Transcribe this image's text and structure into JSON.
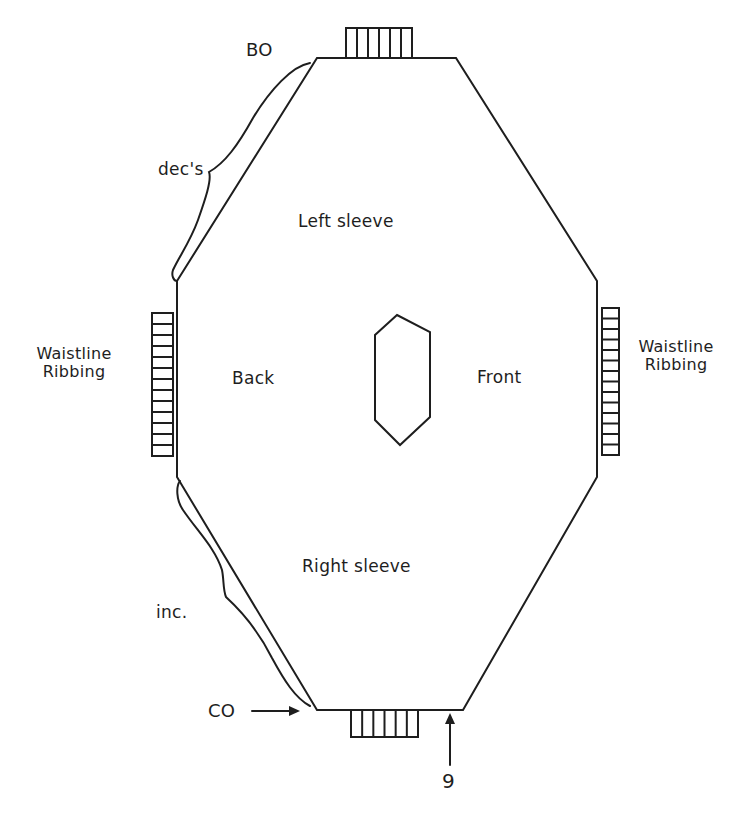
{
  "diagram": {
    "labels": {
      "bind_off": "BO",
      "decreases": "dec's",
      "left_sleeve": "Left sleeve",
      "back": "Back",
      "front": "Front",
      "waistline_ribbing_left": "Waistline\nRibbing",
      "waistline_ribbing_right": "Waistline\nRibbing",
      "right_sleeve": "Right sleeve",
      "increases": "inc.",
      "cast_on": "CO",
      "marker": "9"
    },
    "colors": {
      "ink": "#1e1e1e",
      "paper": "#ffffff"
    },
    "outline_points": [
      [
        317,
        58
      ],
      [
        456,
        58
      ],
      [
        597,
        281
      ],
      [
        597,
        477
      ],
      [
        463,
        710
      ],
      [
        317,
        710
      ],
      [
        177,
        477
      ],
      [
        177,
        281
      ]
    ],
    "neck_opening_points": [
      [
        397,
        315
      ],
      [
        430,
        332
      ],
      [
        430,
        417
      ],
      [
        400,
        445
      ],
      [
        375,
        420
      ],
      [
        375,
        335
      ]
    ],
    "ribbing": {
      "top_cuff": {
        "x": 346,
        "y": 28,
        "width": 66,
        "height": 30,
        "divisions": 6,
        "orientation": "vertical"
      },
      "bottom_cuff": {
        "x": 351,
        "y": 710,
        "width": 67,
        "height": 27,
        "divisions": 6,
        "orientation": "vertical"
      },
      "left_waist": {
        "x": 152,
        "y": 313,
        "width": 21,
        "height": 143,
        "divisions": 13,
        "orientation": "horizontal"
      },
      "right_waist": {
        "x": 602,
        "y": 308,
        "width": 17,
        "height": 147,
        "divisions": 14,
        "orientation": "horizontal"
      }
    }
  }
}
